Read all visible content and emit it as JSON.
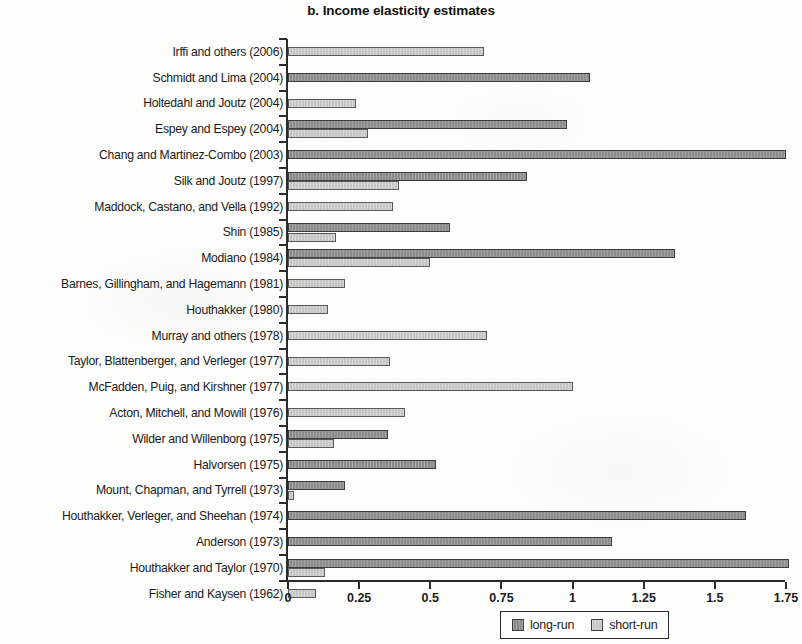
{
  "title": "b. Income elasticity estimates",
  "legend": {
    "long_run_label": "long-run",
    "short_run_label": "short-run",
    "long_run_color": "#8c8c8c",
    "short_run_color": "#c6c6c4"
  },
  "axis": {
    "tick_labels": [
      "0",
      "0.25",
      "0.5",
      "0.75",
      "1",
      "1.25",
      "1.5",
      "1.75"
    ]
  },
  "chart_data": {
    "type": "bar",
    "orientation": "horizontal",
    "title": "b. Income elasticity estimates",
    "xlabel": "",
    "ylabel": "",
    "xlim": [
      0,
      1.75
    ],
    "xticks": [
      0,
      0.25,
      0.5,
      0.75,
      1,
      1.25,
      1.5,
      1.75
    ],
    "grid": false,
    "legend_position": "bottom-center",
    "categories": [
      "Irffi and others (2006)",
      "Schmidt and Lima (2004)",
      "Holtedahl and Joutz (2004)",
      "Espey and Espey (2004)",
      "Chang and Martinez-Combo (2003)",
      "Silk and Joutz (1997)",
      "Maddock, Castano, and Vella (1992)",
      "Shin (1985)",
      "Modiano (1984)",
      "Barnes, Gillingham, and Hagemann (1981)",
      "Houthakker (1980)",
      "Murray and others (1978)",
      "Taylor, Blattenberger, and Verleger (1977)",
      "McFadden, Puig, and Kirshner (1977)",
      "Acton, Mitchell, and Mowill (1976)",
      "Wilder and Willenborg (1975)",
      "Halvorsen (1975)",
      "Mount, Chapman, and Tyrrell (1973)",
      "Houthakker, Verleger, and Sheehan (1974)",
      "Anderson (1973)",
      "Houthakker and Taylor (1970)",
      "Fisher and Kaysen (1962)"
    ],
    "series": [
      {
        "name": "long-run",
        "color": "#8c8c8c",
        "values": [
          null,
          1.06,
          null,
          0.98,
          1.75,
          0.84,
          null,
          0.57,
          1.36,
          null,
          null,
          null,
          null,
          null,
          null,
          0.35,
          0.52,
          0.2,
          1.61,
          1.14,
          1.76,
          null
        ]
      },
      {
        "name": "short-run",
        "color": "#c6c6c4",
        "values": [
          0.69,
          null,
          0.24,
          0.28,
          null,
          0.39,
          0.37,
          0.17,
          0.5,
          0.2,
          0.14,
          0.7,
          0.36,
          1.0,
          0.41,
          0.16,
          null,
          0.02,
          null,
          null,
          0.13,
          0.1
        ]
      }
    ]
  }
}
